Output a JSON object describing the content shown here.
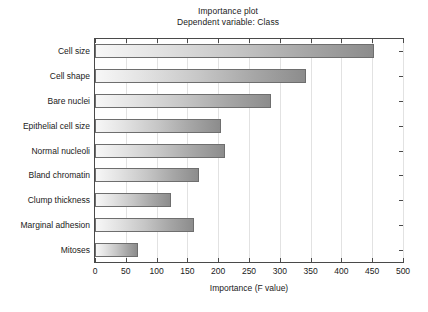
{
  "chart_data": {
    "type": "bar",
    "orientation": "horizontal",
    "title": "Importance plot",
    "subtitle": "Dependent variable: Class",
    "xlabel": "Importance (F value)",
    "ylabel": "",
    "xlim": [
      0,
      500
    ],
    "xticks": [
      0,
      50,
      100,
      150,
      200,
      250,
      300,
      350,
      400,
      450,
      500
    ],
    "xtick_labels": [
      "0",
      "50",
      "100",
      "150",
      "200",
      "250",
      "300",
      "350",
      "400",
      "450",
      "500"
    ],
    "grid": "vertical",
    "legend": "none",
    "categories": [
      "Cell size",
      "Cell shape",
      "Bare nuclei",
      "Epithelial cell size",
      "Normal nucleoli",
      "Bland chromatin",
      "Clump thickness",
      "Marginal adhesion",
      "Mitoses"
    ],
    "values": [
      453,
      342,
      285,
      205,
      211,
      169,
      124,
      161,
      69
    ],
    "bar_fill_start_color": "#f7f7f7",
    "bar_fill_end_color": "#8c8c8c",
    "bar_border_color": "#6e6e6e",
    "gridline_color": "#e2e2e2",
    "axis_color": "#4a4a4a",
    "background_color": "#ffffff"
  }
}
